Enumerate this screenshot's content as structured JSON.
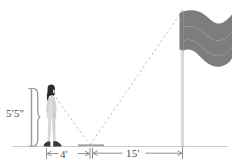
{
  "figure": {
    "labels": {
      "person_height": "5'5\"",
      "distance_person_to_mirror": "4'",
      "distance_mirror_to_flagpole": "15'"
    },
    "elements": {
      "person": "person-figure",
      "flag": "flag-shape",
      "pole": "flagpole",
      "ground": "ground-line",
      "sightline": "dashed-sight-line",
      "mirror": "mirror-on-ground",
      "brace": "height-brace"
    },
    "colors": {
      "flag_fill": "#7a7a7a",
      "pole": "#d8d8d8",
      "ground": "#c9c9c9",
      "dashed": "#bdbdbd",
      "text": "#4a4a4a",
      "person_hair": "#2e2e2e",
      "person_body": "#d5d5d5",
      "person_shoe": "#3a3a3a",
      "background": "#ffffff"
    }
  }
}
